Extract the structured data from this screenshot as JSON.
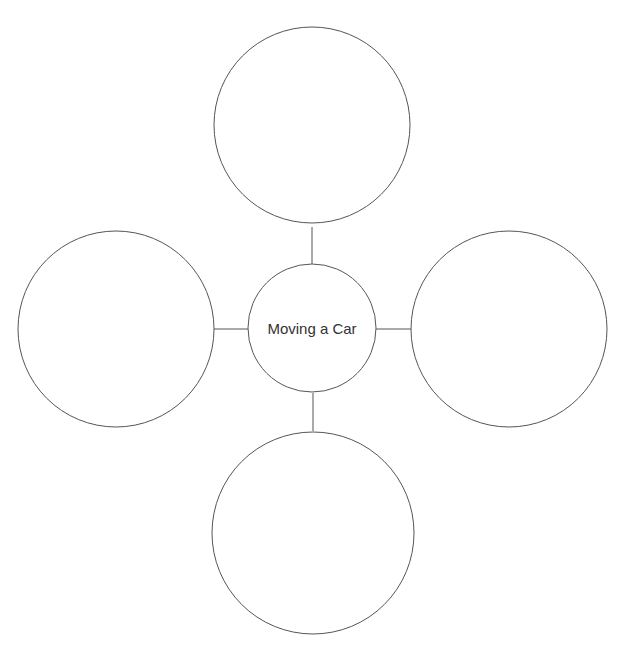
{
  "diagram": {
    "type": "bubble-map",
    "center": {
      "label": "Moving a Car"
    },
    "branches": [
      {
        "position": "top",
        "label": ""
      },
      {
        "position": "left",
        "label": ""
      },
      {
        "position": "right",
        "label": ""
      },
      {
        "position": "bottom",
        "label": ""
      }
    ],
    "colors": {
      "stroke": "#555555",
      "text": "#333333",
      "background": "#ffffff"
    }
  }
}
